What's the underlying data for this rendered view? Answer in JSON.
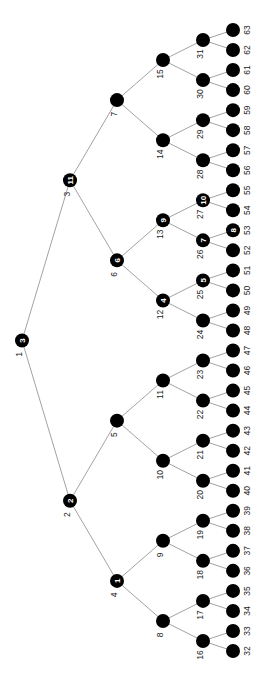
{
  "diagram": {
    "type": "binary-tree",
    "orientation": "rotated-90-ccw",
    "colors": {
      "node": "#000000",
      "edge": "#8a8a8a",
      "badge_text": "#ffffff",
      "label": "#222222"
    },
    "levels_x": [
      22,
      70,
      117,
      163,
      203,
      233
    ],
    "leaf_y_top": 30,
    "leaf_y_bottom": 651,
    "badges": {
      "1": "3",
      "2": "2",
      "3": "11",
      "4": "1",
      "6": "6",
      "12": "4",
      "13": "9",
      "25": "5",
      "26": "7",
      "27": "10",
      "53": "8"
    },
    "node_ids": [
      1,
      2,
      3,
      4,
      5,
      6,
      7,
      8,
      9,
      10,
      11,
      12,
      13,
      14,
      15,
      16,
      17,
      18,
      19,
      20,
      21,
      22,
      23,
      24,
      25,
      26,
      27,
      28,
      29,
      30,
      31,
      32,
      33,
      34,
      35,
      36,
      37,
      38,
      39,
      40,
      41,
      42,
      43,
      44,
      45,
      46,
      47,
      48,
      49,
      50,
      51,
      52,
      53,
      54,
      55,
      56,
      57,
      58,
      59,
      60,
      61,
      62,
      63
    ]
  }
}
